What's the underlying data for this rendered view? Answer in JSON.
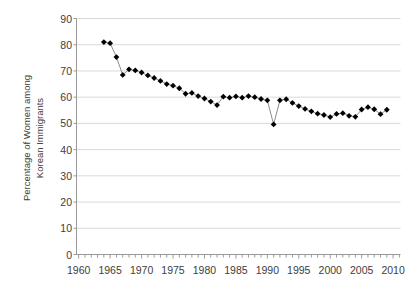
{
  "chart_data": {
    "type": "line",
    "title": "",
    "subtitle": "",
    "xlabel": "",
    "ylabel": "Percentage of Women among Korean Immigrants",
    "ylabel_lines": [
      "Percentage of Women among",
      "Korean Immigrants"
    ],
    "xlim": [
      1958,
      2011
    ],
    "ylim": [
      0,
      90
    ],
    "ytick_step": 10,
    "yticks": [
      0,
      10,
      20,
      30,
      40,
      50,
      60,
      70,
      80,
      90
    ],
    "xticks_major": [
      1960,
      1965,
      1970,
      1975,
      1980,
      1985,
      1990,
      1995,
      2000,
      2005,
      2010
    ],
    "xticks_minor_step": 1,
    "grid": "horizontal",
    "legend": "none",
    "marker": "filled-diamond",
    "marker_color": "#000000",
    "line_color": "#808080",
    "grid_color": "#d9d9d9",
    "axis_color": "#9a9a9a",
    "series": [
      {
        "name": "Percentage of Women among Korean Immigrants",
        "x": [
          1964,
          1965,
          1966,
          1967,
          1968,
          1969,
          1970,
          1971,
          1972,
          1973,
          1974,
          1975,
          1976,
          1977,
          1978,
          1979,
          1980,
          1981,
          1982,
          1983,
          1984,
          1985,
          1986,
          1987,
          1988,
          1989,
          1990,
          1991,
          1992,
          1993,
          1994,
          1995,
          1996,
          1997,
          1998,
          1999,
          2000,
          2001,
          2002,
          2003,
          2004,
          2005,
          2006,
          2007,
          2008,
          2009
        ],
        "values": [
          81.0,
          80.6,
          75.3,
          68.5,
          70.6,
          70.2,
          69.4,
          68.3,
          67.3,
          66.2,
          65.0,
          64.4,
          63.4,
          61.3,
          61.6,
          60.4,
          59.5,
          58.3,
          57.0,
          60.2,
          59.8,
          60.3,
          59.8,
          60.4,
          60.0,
          59.3,
          58.8,
          49.6,
          58.8,
          59.2,
          57.8,
          56.6,
          55.5,
          54.6,
          53.7,
          53.2,
          52.4,
          53.6,
          53.9,
          52.9,
          52.5,
          55.3,
          56.2,
          55.4,
          53.5,
          55.2
        ]
      }
    ]
  }
}
